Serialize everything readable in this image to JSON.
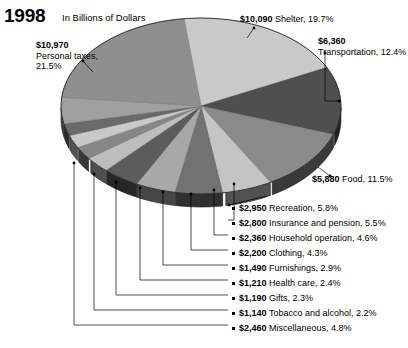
{
  "header": {
    "year": "1998",
    "units": "In Billions of Dollars"
  },
  "chart_data": {
    "type": "pie",
    "title": "1998",
    "subtitle": "In Billions of Dollars",
    "value_prefix": "$",
    "value_unit": "billions of dollars",
    "labels": [
      "Personal taxes",
      "Shelter",
      "Transportation",
      "Food",
      "Recreation",
      "Insurance and pension",
      "Household operation",
      "Clothing",
      "Furnishings",
      "Health care",
      "Gifts",
      "Tobacco and alcohol",
      "Miscellaneous"
    ],
    "values": [
      10970,
      10090,
      6360,
      5880,
      2950,
      2800,
      2360,
      2200,
      1490,
      1210,
      1190,
      1140,
      2460
    ],
    "value_labels": [
      "$10,970",
      "$10,090",
      "$6,360",
      "$5,880",
      "$2,950",
      "$2,800",
      "$2,360",
      "$2,200",
      "$1,490",
      "$1,210",
      "$1,190",
      "$1,140",
      "$2,460"
    ],
    "percents": [
      21.5,
      19.7,
      12.4,
      11.5,
      5.8,
      5.5,
      4.6,
      4.3,
      2.9,
      2.4,
      2.3,
      2.2,
      4.8
    ],
    "percent_labels": [
      "21.5%",
      "19.7%",
      "12.4%",
      "11.5%",
      "5.8%",
      "5.5%",
      "4.6%",
      "4.3%",
      "2.9%",
      "2.4%",
      "2.3%",
      "2.2%",
      "4.8%"
    ],
    "colors": [
      "#8f8f8f",
      "#c9c9c9",
      "#4f4f4f",
      "#8a8a8a",
      "#c4c4c4",
      "#727272",
      "#a8a8a8",
      "#5c5c5c",
      "#bdbdbd",
      "#868686",
      "#c9c9c9",
      "#6a6a6a",
      "#a0a0a0"
    ],
    "legend": "callouts",
    "grid": false,
    "three_d": true
  },
  "callouts": {
    "taxes": {
      "amount": "$10,970",
      "desc": "Personal taxes,",
      "desc2": "21.5%"
    },
    "shelter": {
      "amount": "$10,090",
      "desc": "Shelter, 19.7%"
    },
    "transport": {
      "amount": "$6,360",
      "desc": "Transportation, 12.4%"
    },
    "food": {
      "amount": "$5,880",
      "desc": "Food, 11.5%"
    }
  },
  "list": [
    {
      "amount": "$2,950",
      "desc": "Recreation, 5.8%"
    },
    {
      "amount": "$2,800",
      "desc": "Insurance and pension, 5.5%"
    },
    {
      "amount": "$2,360",
      "desc": "Household operation, 4.6%"
    },
    {
      "amount": "$2,200",
      "desc": "Clothing, 4.3%"
    },
    {
      "amount": "$1,490",
      "desc": "Furnishings, 2.9%"
    },
    {
      "amount": "$1,210",
      "desc": "Health care, 2.4%"
    },
    {
      "amount": "$1,190",
      "desc": "Gifts, 2.3%"
    },
    {
      "amount": "$1,140",
      "desc": "Tobacco and alcohol, 2.2%"
    },
    {
      "amount": "$2,460",
      "desc": "Miscellaneous, 4.8%"
    }
  ]
}
